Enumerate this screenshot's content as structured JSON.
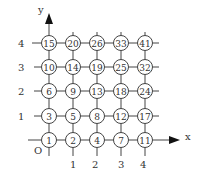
{
  "diagram": {
    "axes": {
      "x_label": "x",
      "y_label": "y",
      "origin_label": "O",
      "x_ticks": [
        "1",
        "2",
        "3",
        "4"
      ],
      "y_ticks": [
        "1",
        "2",
        "3",
        "4"
      ]
    },
    "grid": {
      "rows": [
        {
          "y": 4,
          "values": [
            "15",
            "20",
            "26",
            "33",
            "41"
          ]
        },
        {
          "y": 3,
          "values": [
            "10",
            "14",
            "19",
            "25",
            "32"
          ]
        },
        {
          "y": 2,
          "values": [
            "6",
            "9",
            "13",
            "18",
            "24"
          ]
        },
        {
          "y": 1,
          "values": [
            "3",
            "5",
            "8",
            "12",
            "17"
          ]
        },
        {
          "y": 0,
          "values": [
            "1",
            "2",
            "4",
            "7",
            "11"
          ]
        }
      ]
    },
    "colors": {
      "line": "#444444",
      "text": "#333333",
      "background": "#ffffff"
    }
  }
}
